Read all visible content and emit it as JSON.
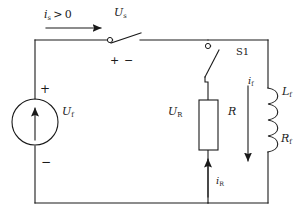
{
  "diagram": {
    "type": "electrical-circuit-schematic",
    "background_color": "#ffffff",
    "line_color": "#1a1a1a",
    "loop": {
      "left_x": 35,
      "right_x": 268,
      "top_y": 40,
      "bottom_y": 203
    }
  },
  "labels": {
    "source_current": {
      "symbol": "i",
      "subscript": "s",
      "relation": ">",
      "value": "0",
      "full": "i_s > 0"
    },
    "switch_voltage": {
      "symbol": "U",
      "subscript": "s",
      "full": "U_s"
    },
    "switch_s1": {
      "full": "S1"
    },
    "source_voltage": {
      "symbol": "U",
      "subscript": "f",
      "full": "U_f"
    },
    "resistor_voltage": {
      "symbol": "U",
      "subscript": "R",
      "full": "U_R"
    },
    "resistor": {
      "symbol": "R",
      "subscript": "",
      "full": "R"
    },
    "field_current": {
      "symbol": "i",
      "subscript": "f",
      "full": "i_f"
    },
    "field_inductance": {
      "symbol": "L",
      "subscript": "f",
      "full": "L_f"
    },
    "field_resistance": {
      "symbol": "R",
      "subscript": "f",
      "full": "R_f"
    },
    "resistor_current": {
      "symbol": "i",
      "subscript": "R",
      "full": "i_R"
    }
  },
  "polarity": {
    "switch_plus": "+",
    "switch_minus": "−",
    "source_plus": "+",
    "source_minus": "−"
  },
  "components": {
    "voltage_source": {
      "name": "U_f",
      "shape": "circle-with-arrow",
      "cx": 62,
      "cy": 122,
      "r": 23,
      "arrow_direction": "up"
    },
    "switch_us": {
      "name": "U_s",
      "state": "open",
      "pivot_x": 110,
      "pivot_y": 40
    },
    "switch_s1": {
      "name": "S1",
      "state": "open",
      "pivot_x": 208,
      "pivot_y": 46
    },
    "resistor_r": {
      "name": "R",
      "shape": "rectangle",
      "x": 199,
      "y": 100,
      "width": 19,
      "height": 50
    },
    "inductor_lf": {
      "name": "L_f",
      "shape": "coil",
      "x": 268,
      "y_top": 88,
      "y_bottom": 152,
      "arcs": 4
    }
  },
  "arrows": {
    "source_current_arrow": {
      "direction": "right",
      "x1": 46,
      "y1": 28,
      "x2": 100,
      "y2": 28
    },
    "field_current_arrow": {
      "direction": "down",
      "x1": 248,
      "y1": 86,
      "x2": 248,
      "y2": 160
    },
    "resistor_current_arrow": {
      "direction": "up",
      "x1": 208,
      "y1": 197,
      "x2": 208,
      "y2": 160
    }
  }
}
